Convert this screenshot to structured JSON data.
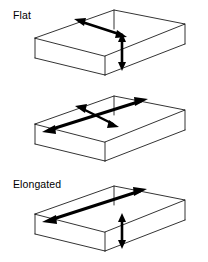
{
  "figure": {
    "type": "diagram",
    "background_color": "#ffffff",
    "line_color": "#000000",
    "arrow_color": "#000000",
    "box_edge_width": 0.8,
    "arrow_width": 2.6
  },
  "panels": [
    {
      "id": "flat",
      "label": "Flat",
      "arrows": [
        {
          "name": "width-arrow",
          "orientation": "diagonal",
          "heads": "both",
          "style": "short"
        },
        {
          "name": "thickness-arrow",
          "orientation": "vertical",
          "heads": "both",
          "style": "short"
        }
      ]
    },
    {
      "id": "elongated",
      "label": "Elongated",
      "arrows": [
        {
          "name": "length-arrow",
          "orientation": "diagonal-long",
          "heads": "both",
          "style": "long"
        },
        {
          "name": "width-arrow",
          "orientation": "diagonal-cross",
          "heads": "both",
          "style": "short"
        }
      ]
    },
    {
      "id": "flat-and-elongated",
      "label": "Flat and Elongated",
      "arrows": [
        {
          "name": "length-arrow",
          "orientation": "diagonal-long",
          "heads": "both",
          "style": "long"
        },
        {
          "name": "thickness-arrow",
          "orientation": "vertical",
          "heads": "both",
          "style": "short"
        }
      ]
    }
  ]
}
